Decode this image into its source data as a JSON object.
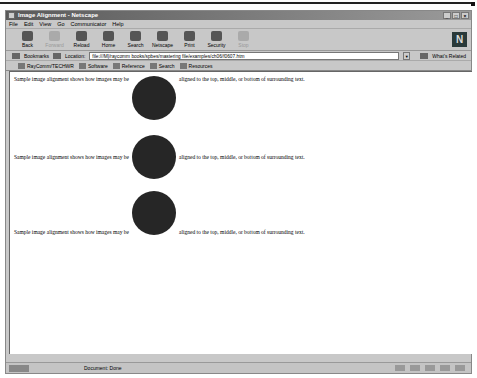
{
  "window": {
    "title": "Image Alignment - Netscape",
    "controls": [
      "_",
      "□",
      "×"
    ]
  },
  "menu": [
    "File",
    "Edit",
    "View",
    "Go",
    "Communicator",
    "Help"
  ],
  "toolbar": {
    "buttons": [
      {
        "label": "Back",
        "icon": "back-icon",
        "enabled": true
      },
      {
        "label": "Forward",
        "icon": "forward-icon",
        "enabled": false
      },
      {
        "label": "Reload",
        "icon": "reload-icon",
        "enabled": true
      },
      {
        "label": "Home",
        "icon": "home-icon",
        "enabled": true
      },
      {
        "label": "Search",
        "icon": "search-icon",
        "enabled": true
      },
      {
        "label": "Netscape",
        "icon": "netscape-icon",
        "enabled": true
      },
      {
        "label": "Print",
        "icon": "print-icon",
        "enabled": true
      },
      {
        "label": "Security",
        "icon": "security-icon",
        "enabled": true
      },
      {
        "label": "Stop",
        "icon": "stop-icon",
        "enabled": false
      }
    ],
    "logo": "N"
  },
  "location": {
    "bookmarks_label": "Bookmarks",
    "location_label": "Location:",
    "url": "file:///M|/raycomm books/spbes/mastering file/examples/ch06/f0607.htm",
    "related_label": "What's Related"
  },
  "personal": [
    "RayComm/TECHWR",
    "Software",
    "Reference",
    "Search",
    "Resources"
  ],
  "content": {
    "rows": [
      {
        "before": "Sample image alignment shows how images may be",
        "after": "aligned to the top, middle, or bottom of surrounding text.",
        "align": "top"
      },
      {
        "before": "Sample image alignment shows how images may be",
        "after": "aligned to the top, middle, or bottom of surrounding text.",
        "align": "middle"
      },
      {
        "before": "Sample image alignment shows how images may be",
        "after": "aligned to the top, middle, or bottom of surrounding text.",
        "align": "bottom"
      }
    ]
  },
  "status": {
    "text": "Document: Done"
  }
}
